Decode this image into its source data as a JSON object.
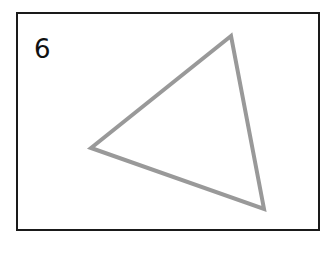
{
  "figure": {
    "label": "6",
    "shape": "triangle",
    "stroke_color": "#999999",
    "frame_color": "#1a1a1a",
    "vertices": [
      [
        231,
        36
      ],
      [
        91,
        148
      ],
      [
        264,
        209
      ]
    ]
  }
}
